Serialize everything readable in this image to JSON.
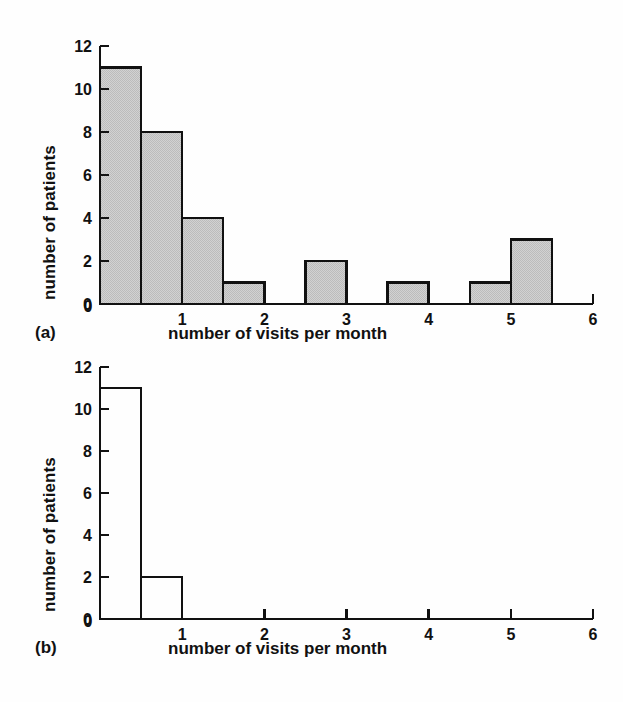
{
  "figure": {
    "background_color": "#fefefe",
    "ink_color": "#111111",
    "bar_fill_color": "#bcbcbc",
    "bar_stroke_color": "#111111"
  },
  "panels": [
    {
      "tag": "(a)",
      "chart_data": {
        "type": "bar",
        "title": "",
        "subtitle": "",
        "xlabel": "number of visits per month",
        "ylabel": "number of patients",
        "xlim": [
          0,
          6
        ],
        "ylim": [
          0,
          12
        ],
        "xticks": [
          0,
          1,
          2,
          3,
          4,
          5,
          6
        ],
        "xtick_labels": [
          "0",
          "1",
          "2",
          "3",
          "4",
          "5",
          "6"
        ],
        "yticks": [
          0,
          2,
          4,
          6,
          8,
          10,
          12
        ],
        "ytick_labels": [
          "0",
          "2",
          "4",
          "6",
          "8",
          "10",
          "12"
        ],
        "grid": false,
        "legend": false,
        "bin_width": 0.5,
        "filled": true,
        "bins": [
          {
            "x0": 0.0,
            "x1": 0.5,
            "value": 11
          },
          {
            "x0": 0.5,
            "x1": 1.0,
            "value": 8
          },
          {
            "x0": 1.0,
            "x1": 1.5,
            "value": 4
          },
          {
            "x0": 1.5,
            "x1": 2.0,
            "value": 1
          },
          {
            "x0": 2.0,
            "x1": 2.5,
            "value": 0
          },
          {
            "x0": 2.5,
            "x1": 3.0,
            "value": 2
          },
          {
            "x0": 3.0,
            "x1": 3.5,
            "value": 0
          },
          {
            "x0": 3.5,
            "x1": 4.0,
            "value": 1
          },
          {
            "x0": 4.0,
            "x1": 4.5,
            "value": 0
          },
          {
            "x0": 4.5,
            "x1": 5.0,
            "value": 1
          },
          {
            "x0": 5.0,
            "x1": 5.5,
            "value": 3
          },
          {
            "x0": 5.5,
            "x1": 6.0,
            "value": 0
          }
        ],
        "categories": [
          "0-0.5",
          "0.5-1",
          "1-1.5",
          "1.5-2",
          "2-2.5",
          "2.5-3",
          "3-3.5",
          "3.5-4",
          "4-4.5",
          "4.5-5",
          "5-5.5",
          "5.5-6"
        ],
        "values": [
          11,
          8,
          4,
          1,
          0,
          2,
          0,
          1,
          0,
          1,
          3,
          0
        ]
      }
    },
    {
      "tag": "(b)",
      "chart_data": {
        "type": "bar",
        "title": "",
        "subtitle": "",
        "xlabel": "number of visits per month",
        "ylabel": "number of patients",
        "xlim": [
          0,
          6
        ],
        "ylim": [
          0,
          12
        ],
        "xticks": [
          0,
          1,
          2,
          3,
          4,
          5,
          6
        ],
        "xtick_labels": [
          "0",
          "1",
          "2",
          "3",
          "4",
          "5",
          "6"
        ],
        "yticks": [
          0,
          2,
          4,
          6,
          8,
          10,
          12
        ],
        "ytick_labels": [
          "0",
          "2",
          "4",
          "6",
          "8",
          "10",
          "12"
        ],
        "grid": false,
        "legend": false,
        "bin_width": 0.5,
        "filled": false,
        "bins": [
          {
            "x0": 0.0,
            "x1": 0.5,
            "value": 11
          },
          {
            "x0": 0.5,
            "x1": 1.0,
            "value": 2
          },
          {
            "x0": 1.0,
            "x1": 1.5,
            "value": 0
          },
          {
            "x0": 1.5,
            "x1": 2.0,
            "value": 0
          },
          {
            "x0": 2.0,
            "x1": 2.5,
            "value": 0
          },
          {
            "x0": 2.5,
            "x1": 3.0,
            "value": 0
          },
          {
            "x0": 3.0,
            "x1": 3.5,
            "value": 0
          },
          {
            "x0": 3.5,
            "x1": 4.0,
            "value": 0
          },
          {
            "x0": 4.0,
            "x1": 4.5,
            "value": 0
          },
          {
            "x0": 4.5,
            "x1": 5.0,
            "value": 0
          },
          {
            "x0": 5.0,
            "x1": 5.5,
            "value": 0
          },
          {
            "x0": 5.5,
            "x1": 6.0,
            "value": 0
          }
        ],
        "categories": [
          "0-0.5",
          "0.5-1",
          "1-1.5",
          "1.5-2",
          "2-2.5",
          "2.5-3",
          "3-3.5",
          "3.5-4",
          "4-4.5",
          "4.5-5",
          "5-5.5",
          "5.5-6"
        ],
        "values": [
          11,
          2,
          0,
          0,
          0,
          0,
          0,
          0,
          0,
          0,
          0,
          0
        ]
      }
    }
  ]
}
